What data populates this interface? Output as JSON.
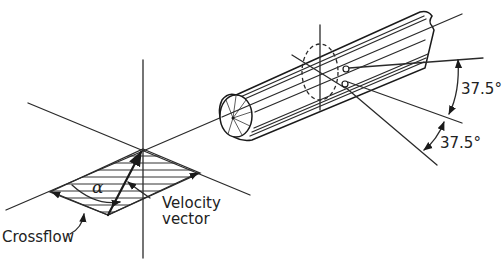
{
  "figure": {
    "labels": {
      "crossflow": "Crossflow",
      "velocity_line1": "Velocity",
      "velocity_line2": "vector",
      "alpha": "α",
      "angle_upper": "37.5°",
      "angle_lower": "37.5°"
    },
    "elements": {
      "left_diagram": "velocity vector resolved into crossflow component on shaded plane",
      "right_diagram": "cylinder with rays at ±37.5° from axis"
    },
    "colors": {
      "line": "#2a2a2a",
      "background": "#ffffff"
    }
  }
}
